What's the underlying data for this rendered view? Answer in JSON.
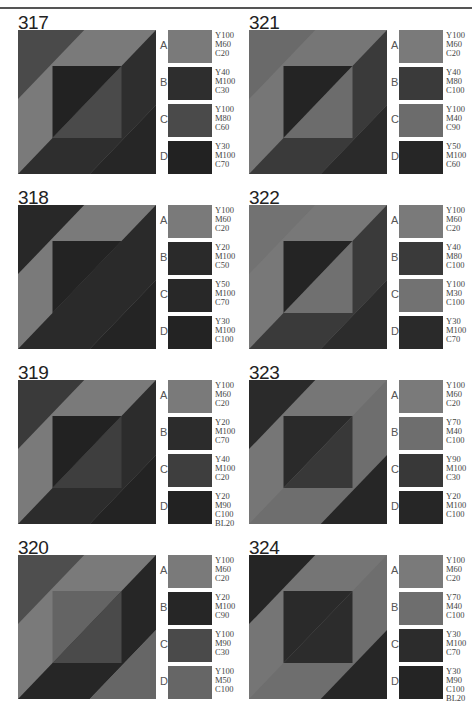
{
  "panels": [
    {
      "id": "317",
      "col": 0,
      "row": 0,
      "regions": {
        "tl": "#4a4a4a",
        "band": "#7a7a7a",
        "inUL": "#222222",
        "inLR": "#4a4a4a",
        "rband": "#2e2e2e",
        "br": "#262626"
      },
      "swatches": [
        {
          "label": "A",
          "color": "#7a7a7a",
          "cmyk": "Y100\nM60\nC20"
        },
        {
          "label": "B",
          "color": "#2e2e2e",
          "cmyk": "Y40\nM100\nC30"
        },
        {
          "label": "C",
          "color": "#4a4a4a",
          "cmyk": "Y100\nM80\nC60"
        },
        {
          "label": "D",
          "color": "#222222",
          "cmyk": "Y30\nM100\nC70"
        }
      ]
    },
    {
      "id": "318",
      "col": 0,
      "row": 1,
      "regions": {
        "tl": "#282828",
        "band": "#7a7a7a",
        "inUL": "#232323",
        "inLR": "#2a2a2a",
        "rband": "#2a2a2a",
        "br": "#242424"
      },
      "swatches": [
        {
          "label": "A",
          "color": "#7a7a7a",
          "cmyk": "Y100\nM60\nC20"
        },
        {
          "label": "B",
          "color": "#2a2a2a",
          "cmyk": "Y20\nM100\nC50"
        },
        {
          "label": "C",
          "color": "#282828",
          "cmyk": "Y50\nM100\nC70"
        },
        {
          "label": "D",
          "color": "#232323",
          "cmyk": "Y30\nM100\nC100"
        }
      ]
    },
    {
      "id": "319",
      "col": 0,
      "row": 2,
      "regions": {
        "tl": "#3a3a3a",
        "band": "#7a7a7a",
        "inUL": "#222222",
        "inLR": "#3e3e3e",
        "rband": "#2c2c2c",
        "br": "#232323"
      },
      "swatches": [
        {
          "label": "A",
          "color": "#7a7a7a",
          "cmyk": "Y100\nM60\nC20"
        },
        {
          "label": "B",
          "color": "#2c2c2c",
          "cmyk": "Y20\nM100\nC70"
        },
        {
          "label": "C",
          "color": "#3e3e3e",
          "cmyk": "Y40\nM100\nC20"
        },
        {
          "label": "D",
          "color": "#222222",
          "cmyk": "Y20\nM90\nC100\nBL20"
        }
      ]
    },
    {
      "id": "320",
      "col": 0,
      "row": 3,
      "regions": {
        "tl": "#4e4e4e",
        "band": "#7a7a7a",
        "inUL": "#646464",
        "inLR": "#4a4a4a",
        "rband": "#262626",
        "br": "#666666"
      },
      "swatches": [
        {
          "label": "A",
          "color": "#7a7a7a",
          "cmyk": "Y100\nM60\nC20"
        },
        {
          "label": "B",
          "color": "#262626",
          "cmyk": "Y20\nM100\nC90"
        },
        {
          "label": "C",
          "color": "#4a4a4a",
          "cmyk": "Y100\nM90\nC30"
        },
        {
          "label": "D",
          "color": "#666666",
          "cmyk": "Y100\nM50\nC100"
        }
      ]
    },
    {
      "id": "321",
      "col": 1,
      "row": 0,
      "regions": {
        "tl": "#6a6a6a",
        "band": "#767676",
        "inUL": "#242424",
        "inLR": "#6c6c6c",
        "rband": "#3a3a3a",
        "br": "#2a2a2a"
      },
      "swatches": [
        {
          "label": "A",
          "color": "#7a7a7a",
          "cmyk": "Y100\nM60\nC20"
        },
        {
          "label": "B",
          "color": "#3a3a3a",
          "cmyk": "Y40\nM80\nC100"
        },
        {
          "label": "C",
          "color": "#6c6c6c",
          "cmyk": "Y100\nM40\nC90"
        },
        {
          "label": "D",
          "color": "#262626",
          "cmyk": "Y50\nM100\nC60"
        }
      ]
    },
    {
      "id": "322",
      "col": 1,
      "row": 1,
      "regions": {
        "tl": "#727272",
        "band": "#787878",
        "inUL": "#242424",
        "inLR": "#707070",
        "rband": "#3a3a3a",
        "br": "#2c2c2c"
      },
      "swatches": [
        {
          "label": "A",
          "color": "#7a7a7a",
          "cmyk": "Y100\nM60\nC20"
        },
        {
          "label": "B",
          "color": "#3a3a3a",
          "cmyk": "Y40\nM80\nC100"
        },
        {
          "label": "C",
          "color": "#727272",
          "cmyk": "Y100\nM30\nC100"
        },
        {
          "label": "D",
          "color": "#2a2a2a",
          "cmyk": "Y30\nM100\nC70"
        }
      ]
    },
    {
      "id": "323",
      "col": 1,
      "row": 2,
      "regions": {
        "tl": "#2a2a2a",
        "band": "#767676",
        "inUL": "#2a2a2a",
        "inLR": "#383838",
        "rband": "#6e6e6e",
        "br": "#262626"
      },
      "swatches": [
        {
          "label": "A",
          "color": "#7a7a7a",
          "cmyk": "Y100\nM60\nC20"
        },
        {
          "label": "B",
          "color": "#6e6e6e",
          "cmyk": "Y70\nM40\nC100"
        },
        {
          "label": "C",
          "color": "#383838",
          "cmyk": "Y90\nM100\nC30"
        },
        {
          "label": "D",
          "color": "#262626",
          "cmyk": "Y20\nM100\nC100"
        }
      ]
    },
    {
      "id": "324",
      "col": 1,
      "row": 3,
      "regions": {
        "tl": "#252525",
        "band": "#757575",
        "inUL": "#2a2a2a",
        "inLR": "#2c2c2c",
        "rband": "#6e6e6e",
        "br": "#262626"
      },
      "swatches": [
        {
          "label": "A",
          "color": "#7a7a7a",
          "cmyk": "Y100\nM60\nC20"
        },
        {
          "label": "B",
          "color": "#6e6e6e",
          "cmyk": "Y70\nM40\nC100"
        },
        {
          "label": "C",
          "color": "#2c2c2c",
          "cmyk": "Y30\nM100\nC70"
        },
        {
          "label": "D",
          "color": "#242424",
          "cmyk": "Y30\nM90\nC100\nBL20"
        }
      ]
    }
  ]
}
